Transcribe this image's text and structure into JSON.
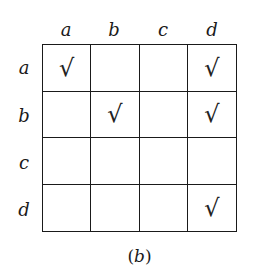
{
  "diagram": {
    "columns": [
      "a",
      "b",
      "c",
      "d"
    ],
    "rows": [
      "a",
      "b",
      "c",
      "d"
    ],
    "check_symbol": "√",
    "matrix": [
      [
        true,
        false,
        false,
        true
      ],
      [
        false,
        true,
        false,
        true
      ],
      [
        false,
        false,
        false,
        false
      ],
      [
        false,
        false,
        false,
        true
      ]
    ],
    "caption": {
      "open": "(",
      "letter": "b",
      "close": ")"
    }
  }
}
